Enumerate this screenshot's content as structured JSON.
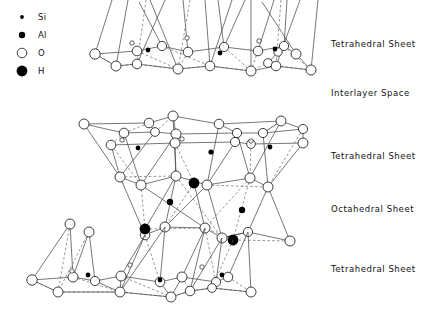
{
  "figure": {
    "width": 429,
    "height": 316,
    "background_color": "#ffffff",
    "line_color": "#4a4a4a"
  },
  "legend": {
    "items": [
      {
        "symbol": "Si",
        "marker": "small-filled-dot",
        "radius": 1.8,
        "color": "#000000",
        "x": 22,
        "y": 17,
        "label_x": 38,
        "label_y": 20
      },
      {
        "symbol": "Al",
        "marker": "medium-filled-dot",
        "radius": 3.0,
        "color": "#000000",
        "x": 22,
        "y": 35,
        "label_x": 38,
        "label_y": 38
      },
      {
        "symbol": "O",
        "marker": "open-circle",
        "radius": 4.6,
        "color": "#ffffff",
        "x": 22,
        "y": 53,
        "label_x": 38,
        "label_y": 56
      },
      {
        "symbol": "H",
        "marker": "large-filled-circle",
        "radius": 5.2,
        "color": "#000000",
        "x": 22,
        "y": 71,
        "label_x": 38,
        "label_y": 74
      }
    ]
  },
  "sheet_labels": [
    {
      "text": "Tetrahedral  Sheet",
      "x": 331,
      "y": 47,
      "name": "label-tetrahedral-sheet-top"
    },
    {
      "text": "Interlayer  Space",
      "x": 331,
      "y": 96,
      "name": "label-interlayer-space"
    },
    {
      "text": "Tetrahedral  Sheet",
      "x": 331,
      "y": 159,
      "name": "label-tetrahedral-sheet-middle"
    },
    {
      "text": "Octahedral  Sheet",
      "x": 331,
      "y": 212,
      "name": "label-octahedral-sheet"
    },
    {
      "text": "Tetrahedral  Sheet",
      "x": 331,
      "y": 272,
      "name": "label-tetrahedral-sheet-bottom"
    }
  ],
  "structure": {
    "description": "Three tetrahedral sheets and one octahedral sheet forming a 2:1 phyllosilicate layer with an interlayer space",
    "atom_radii": {
      "O_large": 5.0,
      "O_small": 2.2,
      "Si": 1.7,
      "Al": 2.6,
      "H": 4.8
    },
    "top_sheet": {
      "name": "tetrahedral-sheet-top",
      "o_upper_row": [
        [
          95,
          54
        ],
        [
          137,
          51
        ],
        [
          162,
          46
        ],
        [
          188,
          52
        ],
        [
          224,
          47
        ],
        [
          258,
          51
        ],
        [
          284,
          46
        ],
        [
          296,
          54
        ],
        [
          278,
          52
        ]
      ],
      "o_lower_row": [
        [
          116,
          66
        ],
        [
          137,
          64
        ],
        [
          178,
          69
        ],
        [
          210,
          66
        ],
        [
          251,
          71
        ],
        [
          268,
          63
        ],
        [
          276,
          66
        ],
        [
          311,
          70
        ]
      ],
      "o_small": [
        [
          132,
          43
        ],
        [
          187,
          38
        ],
        [
          259,
          41
        ]
      ],
      "si_dots": [
        [
          148,
          50
        ],
        [
          220,
          53
        ],
        [
          275,
          49
        ]
      ],
      "apex_lines": [
        [
          128,
          0,
          115,
          64
        ],
        [
          139,
          0,
          160,
          46
        ],
        [
          165,
          0,
          138,
          64
        ],
        [
          150,
          0,
          178,
          67
        ],
        [
          187,
          0,
          163,
          47
        ],
        [
          205,
          0,
          212,
          65
        ],
        [
          232,
          0,
          210,
          66
        ],
        [
          251,
          0,
          250,
          70
        ],
        [
          274,
          0,
          258,
          52
        ],
        [
          287,
          0,
          283,
          47
        ],
        [
          300,
          0,
          276,
          66
        ],
        [
          262,
          0,
          296,
          54
        ],
        [
          112,
          0,
          95,
          54
        ],
        [
          183,
          0,
          188,
          52
        ],
        [
          318,
          0,
          311,
          70
        ]
      ]
    },
    "middle_sheet": {
      "name": "tetrahedral-sheet-middle",
      "o_upper_row": [
        [
          84,
          124
        ],
        [
          149,
          123
        ],
        [
          173,
          116
        ],
        [
          219,
          124
        ],
        [
          281,
          121
        ],
        [
          124,
          133
        ],
        [
          155,
          132
        ],
        [
          176,
          134
        ],
        [
          237,
          133
        ],
        [
          263,
          133
        ],
        [
          303,
          129
        ]
      ],
      "o_lower_row": [
        [
          111,
          145
        ],
        [
          175,
          143
        ],
        [
          235,
          142
        ],
        [
          251,
          144
        ],
        [
          303,
          143
        ]
      ],
      "o_small": [
        [
          122,
          140
        ],
        [
          182,
          139
        ],
        [
          251,
          141
        ]
      ],
      "si_dots": [
        [
          138,
          148
        ],
        [
          211,
          152
        ],
        [
          270,
          147
        ]
      ]
    },
    "octahedral_sheet": {
      "name": "octahedral-sheet",
      "o_atoms": [
        [
          120,
          177
        ],
        [
          141,
          185
        ],
        [
          176,
          176
        ],
        [
          207,
          185
        ],
        [
          250,
          178
        ],
        [
          268,
          187
        ],
        [
          145,
          235
        ],
        [
          165,
          227
        ],
        [
          205,
          228
        ],
        [
          222,
          238
        ],
        [
          248,
          232
        ],
        [
          290,
          241
        ]
      ],
      "h_atoms": [
        [
          194,
          183
        ],
        [
          145,
          229
        ],
        [
          233,
          240
        ]
      ],
      "al_dots": [
        [
          170,
          202
        ],
        [
          242,
          210
        ]
      ]
    },
    "bottom_sheet": {
      "name": "tetrahedral-sheet-bottom",
      "o_upper_row": [
        [
          70,
          224
        ],
        [
          89,
          232
        ],
        [
          32,
          280
        ],
        [
          73,
          277
        ],
        [
          95,
          281
        ],
        [
          121,
          276
        ],
        [
          160,
          282
        ],
        [
          182,
          277
        ],
        [
          216,
          282
        ],
        [
          228,
          277
        ]
      ],
      "o_lower_row": [
        [
          58,
          292
        ],
        [
          120,
          292
        ],
        [
          171,
          297
        ],
        [
          190,
          291
        ],
        [
          212,
          288
        ],
        [
          251,
          292
        ]
      ],
      "o_small": [
        [
          72,
          271
        ],
        [
          130,
          265
        ],
        [
          202,
          267
        ]
      ],
      "si_dots": [
        [
          88,
          275
        ],
        [
          160,
          280
        ],
        [
          222,
          275
        ]
      ]
    }
  }
}
